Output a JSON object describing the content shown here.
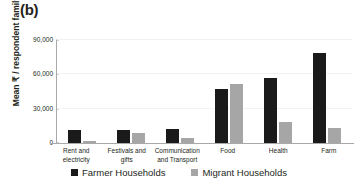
{
  "panel": {
    "label": "(b)"
  },
  "chart_data": {
    "type": "bar",
    "title": "",
    "subtitle": "",
    "xlabel": "",
    "ylabel": "Mean ₹ / respondent family",
    "ylim": [
      0,
      90000
    ],
    "yticks": [
      "0",
      "30,000",
      "60,000",
      "90,000"
    ],
    "ytick_values": [
      0,
      30000,
      60000,
      90000
    ],
    "grid": true,
    "grid_axis": "y",
    "legend_position": "bottom",
    "categories": [
      "Rent and electricity",
      "Festivals and gifts",
      "Communication and Transport",
      "Food",
      "Health",
      "Farm"
    ],
    "series": [
      {
        "name": "Farmer Households",
        "color": "#1a1a1a",
        "values": [
          11500,
          11800,
          12500,
          47000,
          57000,
          79000
        ]
      },
      {
        "name": "Migrant Households",
        "color": "#a6a6a6",
        "values": [
          2000,
          9000,
          4000,
          51500,
          18500,
          13500
        ]
      }
    ]
  },
  "axis": {
    "line_color": "#a9a9a9",
    "grid_color": "#f2f2f2"
  }
}
